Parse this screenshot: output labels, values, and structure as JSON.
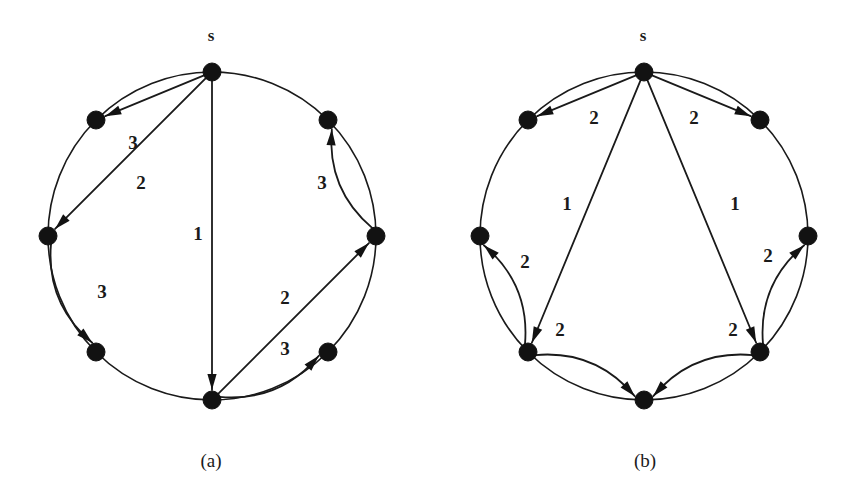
{
  "figure": {
    "background_color": "#ffffff",
    "ink_color": "#1a1a1a",
    "node_color": "#121212"
  },
  "panels": [
    {
      "id": "panel-a",
      "caption": "(a)",
      "caption_pos": {
        "x": 211,
        "y": 463
      },
      "source_label": "s",
      "source_label_pos": {
        "x": 211,
        "y": 37
      },
      "center": {
        "x": 212,
        "y": 236
      },
      "radius": 164,
      "node_radius": 9,
      "nodes": [
        {
          "name": "s",
          "angle_deg": 270,
          "x": 212,
          "y": 72
        },
        {
          "name": "v1",
          "angle_deg": 315,
          "x": 328,
          "y": 120
        },
        {
          "name": "v2",
          "angle_deg": 0,
          "x": 376,
          "y": 236
        },
        {
          "name": "v3",
          "angle_deg": 45,
          "x": 328,
          "y": 352
        },
        {
          "name": "v4",
          "angle_deg": 90,
          "x": 212,
          "y": 400
        },
        {
          "name": "v5",
          "angle_deg": 135,
          "x": 96,
          "y": 352
        },
        {
          "name": "v6",
          "angle_deg": 180,
          "x": 48,
          "y": 236
        },
        {
          "name": "v7",
          "angle_deg": 225,
          "x": 96,
          "y": 120
        }
      ],
      "edges": [
        {
          "id": "a-s-v7",
          "from": "s",
          "to": "v7",
          "weight": "3",
          "bow": 0,
          "label_pos": {
            "x": 133,
            "y": 145
          }
        },
        {
          "id": "a-s-v6",
          "from": "s",
          "to": "v6",
          "weight": "2",
          "bow": 0,
          "label_pos": {
            "x": 141,
            "y": 185
          }
        },
        {
          "id": "a-s-v4",
          "from": "s",
          "to": "v4",
          "weight": "1",
          "bow": 0,
          "label_pos": {
            "x": 198,
            "y": 236
          }
        },
        {
          "id": "a-v6-v5",
          "from": "v6",
          "to": "v5",
          "weight": "3",
          "bow": 14,
          "label_pos": {
            "x": 102,
            "y": 294
          }
        },
        {
          "id": "a-v4-v2",
          "from": "v4",
          "to": "v2",
          "weight": "2",
          "bow": 0,
          "label_pos": {
            "x": 285,
            "y": 300
          }
        },
        {
          "id": "a-v4-v3",
          "from": "v4",
          "to": "v3",
          "weight": "3",
          "bow": 14,
          "label_pos": {
            "x": 285,
            "y": 351
          }
        },
        {
          "id": "a-v2-v1",
          "from": "v2",
          "to": "v1",
          "weight": "3",
          "bow": -14,
          "label_pos": {
            "x": 322,
            "y": 185
          }
        }
      ]
    },
    {
      "id": "panel-b",
      "caption": "(b)",
      "caption_pos": {
        "x": 645,
        "y": 463
      },
      "source_label": "s",
      "source_label_pos": {
        "x": 643,
        "y": 37
      },
      "center": {
        "x": 644,
        "y": 236
      },
      "radius": 164,
      "node_radius": 9,
      "nodes": [
        {
          "name": "s",
          "angle_deg": 270,
          "x": 644,
          "y": 72
        },
        {
          "name": "v1",
          "angle_deg": 315,
          "x": 760,
          "y": 120
        },
        {
          "name": "v2",
          "angle_deg": 0,
          "x": 808,
          "y": 236
        },
        {
          "name": "v3",
          "angle_deg": 45,
          "x": 760,
          "y": 352
        },
        {
          "name": "v4",
          "angle_deg": 90,
          "x": 644,
          "y": 400
        },
        {
          "name": "v5",
          "angle_deg": 135,
          "x": 528,
          "y": 352
        },
        {
          "name": "v6",
          "angle_deg": 180,
          "x": 480,
          "y": 236
        },
        {
          "name": "v7",
          "angle_deg": 225,
          "x": 528,
          "y": 120
        }
      ],
      "edges": [
        {
          "id": "b-s-v7",
          "from": "s",
          "to": "v7",
          "weight": "2",
          "bow": 0,
          "label_pos": {
            "x": 594,
            "y": 120
          }
        },
        {
          "id": "b-s-v1",
          "from": "s",
          "to": "v1",
          "weight": "2",
          "bow": 0,
          "label_pos": {
            "x": 694,
            "y": 120
          }
        },
        {
          "id": "b-s-v5",
          "from": "s",
          "to": "v5",
          "weight": "1",
          "bow": 0,
          "label_pos": {
            "x": 567,
            "y": 206
          }
        },
        {
          "id": "b-s-v3",
          "from": "s",
          "to": "v3",
          "weight": "1",
          "bow": 0,
          "label_pos": {
            "x": 735,
            "y": 206
          }
        },
        {
          "id": "b-v5-v6",
          "from": "v5",
          "to": "v6",
          "weight": "2",
          "bow": 14,
          "label_pos": {
            "x": 525,
            "y": 264
          }
        },
        {
          "id": "b-v5-v4",
          "from": "v5",
          "to": "v4",
          "weight": "2",
          "bow": -14,
          "label_pos": {
            "x": 560,
            "y": 332
          }
        },
        {
          "id": "b-v3-v2",
          "from": "v3",
          "to": "v2",
          "weight": "2",
          "bow": -14,
          "label_pos": {
            "x": 768,
            "y": 258
          }
        },
        {
          "id": "b-v3-v4",
          "from": "v3",
          "to": "v4",
          "weight": "2",
          "bow": 14,
          "label_pos": {
            "x": 733,
            "y": 332
          }
        }
      ]
    }
  ]
}
